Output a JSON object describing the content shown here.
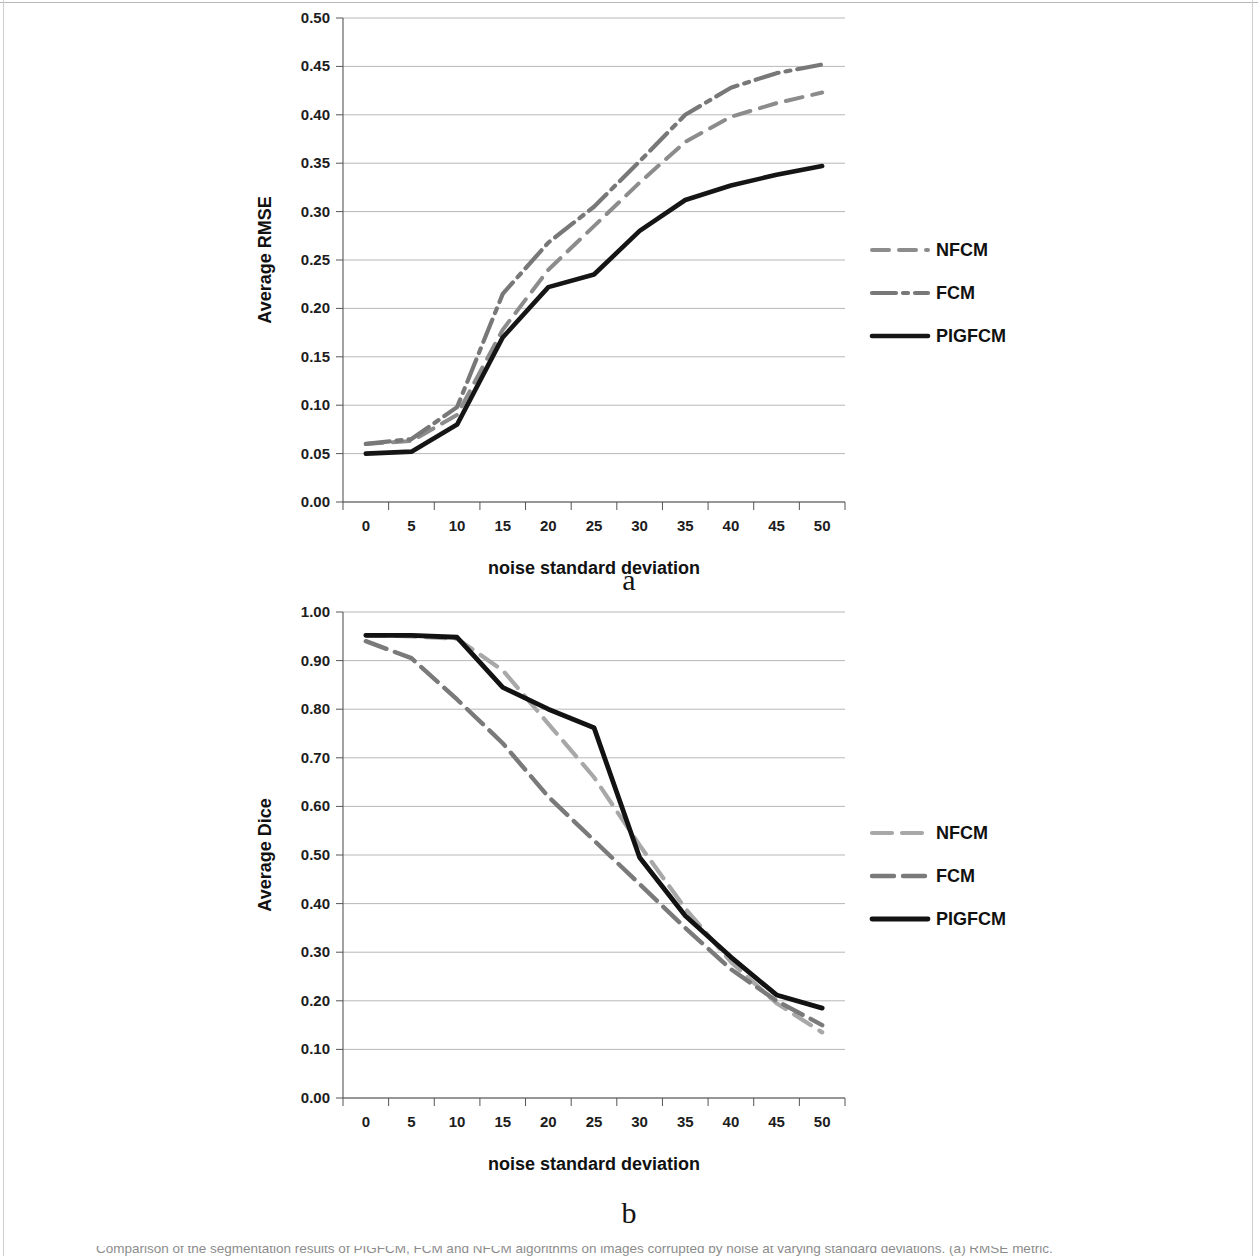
{
  "figure": {
    "panel_a_letter": "a",
    "panel_b_letter": "b",
    "caption": "Comparison of the segmentation results of PIGFCM, FCM and NFCM algorithms on images corrupted by noise at varying standard deviations. (a) RMSE metric."
  },
  "chart_data": [
    {
      "id": "chart-a",
      "type": "line",
      "title": "",
      "xlabel": "noise standard deviation",
      "ylabel": "Average RMSE",
      "x": [
        0,
        5,
        10,
        15,
        20,
        25,
        30,
        35,
        40,
        45,
        50
      ],
      "xlim": [
        0,
        50
      ],
      "ylim": [
        0.0,
        0.5
      ],
      "xticks": [
        "0",
        "5",
        "10",
        "15",
        "20",
        "25",
        "30",
        "35",
        "40",
        "45",
        "50"
      ],
      "yticks": [
        "0.00",
        "0.05",
        "0.10",
        "0.15",
        "0.20",
        "0.25",
        "0.30",
        "0.35",
        "0.40",
        "0.45",
        "0.50"
      ],
      "ytick_values": [
        0.0,
        0.05,
        0.1,
        0.15,
        0.2,
        0.25,
        0.3,
        0.35,
        0.4,
        0.45,
        0.5
      ],
      "grid": true,
      "legend_position": "right",
      "series": [
        {
          "name": "NFCM",
          "values": [
            0.06,
            0.063,
            0.09,
            0.178,
            0.24,
            0.285,
            0.33,
            0.372,
            0.398,
            0.412,
            0.423
          ],
          "color": "#8c8c8c",
          "width": 4.0,
          "dash": "17,10"
        },
        {
          "name": "FCM",
          "values": [
            0.06,
            0.065,
            0.098,
            0.215,
            0.268,
            0.305,
            0.352,
            0.4,
            0.428,
            0.443,
            0.452
          ],
          "color": "#787878",
          "width": 4.2,
          "dash": "24,7,5,7"
        },
        {
          "name": "PIGFCM",
          "values": [
            0.05,
            0.052,
            0.08,
            0.17,
            0.222,
            0.235,
            0.28,
            0.312,
            0.327,
            0.338,
            0.347
          ],
          "color": "#151515",
          "width": 4.6,
          "dash": "none"
        }
      ]
    },
    {
      "id": "chart-b",
      "type": "line",
      "title": "",
      "xlabel": "noise standard deviation",
      "ylabel": "Average Dice",
      "x": [
        0,
        5,
        10,
        15,
        20,
        25,
        30,
        35,
        40,
        45,
        50
      ],
      "xlim": [
        0,
        50
      ],
      "ylim": [
        0.0,
        1.0
      ],
      "xticks": [
        "0",
        "5",
        "10",
        "15",
        "20",
        "25",
        "30",
        "35",
        "40",
        "45",
        "50"
      ],
      "yticks": [
        "0.00",
        "0.10",
        "0.20",
        "0.30",
        "0.40",
        "0.50",
        "0.60",
        "0.70",
        "0.80",
        "0.90",
        "1.00"
      ],
      "ytick_values": [
        0.0,
        0.1,
        0.2,
        0.3,
        0.4,
        0.5,
        0.6,
        0.7,
        0.8,
        0.9,
        1.0
      ],
      "grid": true,
      "legend_position": "right",
      "series": [
        {
          "name": "NFCM",
          "values": [
            0.952,
            0.95,
            0.945,
            0.88,
            0.77,
            0.66,
            0.52,
            0.39,
            0.28,
            0.195,
            0.135
          ],
          "color": "#a8a8a8",
          "width": 4.2,
          "dash": "20,10"
        },
        {
          "name": "FCM",
          "values": [
            0.94,
            0.905,
            0.82,
            0.73,
            0.62,
            0.53,
            0.44,
            0.35,
            0.265,
            0.2,
            0.15
          ],
          "color": "#7a7a7a",
          "width": 4.4,
          "dash": "22,9"
        },
        {
          "name": "PIGFCM",
          "values": [
            0.952,
            0.952,
            0.948,
            0.845,
            0.8,
            0.762,
            0.495,
            0.375,
            0.29,
            0.212,
            0.185
          ],
          "color": "#121212",
          "width": 4.8,
          "dash": "none"
        }
      ]
    }
  ]
}
